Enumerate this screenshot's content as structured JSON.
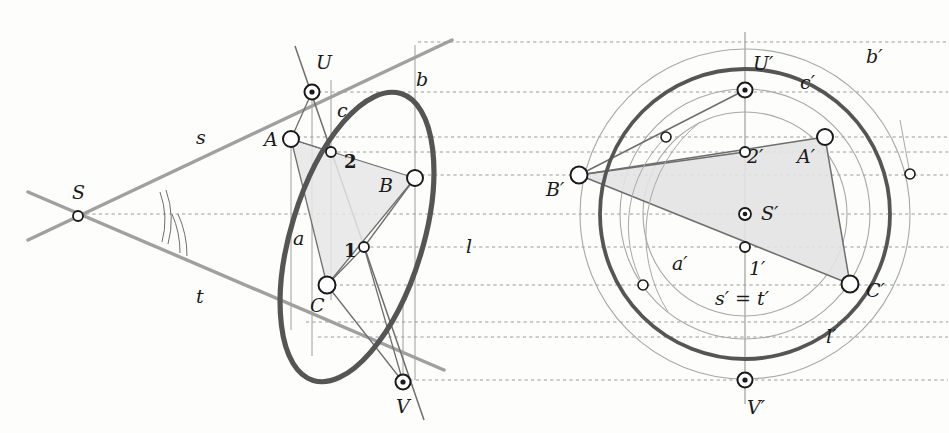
{
  "figure": {
    "background_color": "#fdfdfb",
    "colors": {
      "conic_stroke": "#4a4a4a",
      "auxiliary_line": "#8c8c8c",
      "thin_line": "#6e6e6e",
      "dotted_line": "#9a9a9a",
      "fill_triangle": "#e3e3e3",
      "node_fill": "#ffffff",
      "node_stroke": "#1a1a1a",
      "text": "#1a1a1a"
    }
  },
  "left_view": {
    "name": "oblique-ellipse-view",
    "labels": [
      {
        "id": "S",
        "text": "S",
        "x": 72,
        "y": 199,
        "kind": "italic"
      },
      {
        "id": "s",
        "text": "s",
        "x": 196,
        "y": 144,
        "kind": "italic"
      },
      {
        "id": "t",
        "text": "t",
        "x": 196,
        "y": 303,
        "kind": "italic"
      },
      {
        "id": "U",
        "text": "U",
        "x": 316,
        "y": 69,
        "kind": "italic"
      },
      {
        "id": "A",
        "text": "A",
        "x": 264,
        "y": 146,
        "kind": "italic"
      },
      {
        "id": "B",
        "text": "B",
        "x": 379,
        "y": 192,
        "kind": "italic"
      },
      {
        "id": "C",
        "text": "C",
        "x": 310,
        "y": 312,
        "kind": "italic"
      },
      {
        "id": "V",
        "text": "V",
        "x": 396,
        "y": 413,
        "kind": "italic"
      },
      {
        "id": "b",
        "text": "b",
        "x": 416,
        "y": 86,
        "kind": "italic"
      },
      {
        "id": "c",
        "text": "c",
        "x": 337,
        "y": 117,
        "kind": "italic"
      },
      {
        "id": "a",
        "text": "a",
        "x": 293,
        "y": 245,
        "kind": "italic"
      },
      {
        "id": "l",
        "text": "l",
        "x": 466,
        "y": 253,
        "kind": "italic"
      },
      {
        "id": "p1",
        "text": "1",
        "x": 344,
        "y": 257,
        "kind": "number"
      },
      {
        "id": "p2",
        "text": "2",
        "x": 344,
        "y": 168,
        "kind": "number"
      }
    ],
    "points": [
      {
        "id": "S",
        "x": 78,
        "y": 216,
        "type": "small"
      },
      {
        "id": "U",
        "x": 312,
        "y": 92,
        "type": "double"
      },
      {
        "id": "V",
        "x": 403,
        "y": 382,
        "type": "double"
      },
      {
        "id": "A",
        "x": 291,
        "y": 139,
        "type": "large"
      },
      {
        "id": "B",
        "x": 415,
        "y": 178,
        "type": "large"
      },
      {
        "id": "C",
        "x": 327,
        "y": 285,
        "type": "large"
      },
      {
        "id": "1",
        "x": 364,
        "y": 247,
        "type": "small"
      },
      {
        "id": "2",
        "x": 331,
        "y": 152,
        "type": "small"
      }
    ]
  },
  "right_view": {
    "name": "circle-image-view",
    "labels": [
      {
        "id": "Up",
        "text": "U′",
        "x": 753,
        "y": 70,
        "kind": "italic"
      },
      {
        "id": "bp",
        "text": "b′",
        "x": 866,
        "y": 63,
        "kind": "italic"
      },
      {
        "id": "cp",
        "text": "c′",
        "x": 800,
        "y": 89,
        "kind": "italic"
      },
      {
        "id": "Ap",
        "text": "A′",
        "x": 797,
        "y": 163,
        "kind": "italic"
      },
      {
        "id": "2p",
        "text": "2′",
        "x": 747,
        "y": 163,
        "kind": "italic"
      },
      {
        "id": "Bp",
        "text": "B′",
        "x": 546,
        "y": 196,
        "kind": "italic"
      },
      {
        "id": "Sp",
        "text": "S′",
        "x": 761,
        "y": 220,
        "kind": "italic"
      },
      {
        "id": "1p",
        "text": "1′",
        "x": 749,
        "y": 275,
        "kind": "italic"
      },
      {
        "id": "ap",
        "text": "a′",
        "x": 672,
        "y": 270,
        "kind": "italic"
      },
      {
        "id": "st",
        "text": "s′ = t′",
        "x": 715,
        "y": 305,
        "kind": "italic"
      },
      {
        "id": "Cp",
        "text": "C′",
        "x": 866,
        "y": 297,
        "kind": "italic"
      },
      {
        "id": "lp",
        "text": "l′",
        "x": 826,
        "y": 343,
        "kind": "italic"
      },
      {
        "id": "Vp",
        "text": "V′",
        "x": 747,
        "y": 414,
        "kind": "italic"
      }
    ],
    "points": [
      {
        "id": "Up",
        "x": 745,
        "y": 90,
        "type": "double"
      },
      {
        "id": "Vp",
        "x": 745,
        "y": 380,
        "type": "double"
      },
      {
        "id": "Sp",
        "x": 745,
        "y": 214,
        "type": "double"
      },
      {
        "id": "Ap",
        "x": 825,
        "y": 137,
        "type": "large"
      },
      {
        "id": "Bp",
        "x": 579,
        "y": 175,
        "type": "large"
      },
      {
        "id": "Cp",
        "x": 850,
        "y": 284,
        "type": "large"
      },
      {
        "id": "1p",
        "x": 745,
        "y": 247,
        "type": "small"
      },
      {
        "id": "2p",
        "x": 745,
        "y": 152,
        "type": "small"
      },
      {
        "id": "aux-upper",
        "x": 666,
        "y": 137,
        "type": "small"
      },
      {
        "id": "aux-lower",
        "x": 643,
        "y": 285,
        "type": "small"
      },
      {
        "id": "aux-right",
        "x": 910,
        "y": 174,
        "type": "small"
      }
    ],
    "circles": [
      {
        "id": "circle-b-prime",
        "cx": 745,
        "cy": 214,
        "r": 165
      },
      {
        "id": "circle-l-prime",
        "cx": 745,
        "cy": 214,
        "r": 145
      },
      {
        "id": "circle-c-prime",
        "cx": 745,
        "cy": 214,
        "r": 125
      },
      {
        "id": "circle-a-prime",
        "cx": 745,
        "cy": 214,
        "r": 102
      }
    ]
  },
  "correspondence_lines": {
    "name": "affinity-rays",
    "y_values": [
      42,
      92,
      137,
      152,
      175,
      214,
      247,
      285,
      322,
      337,
      372
    ]
  }
}
